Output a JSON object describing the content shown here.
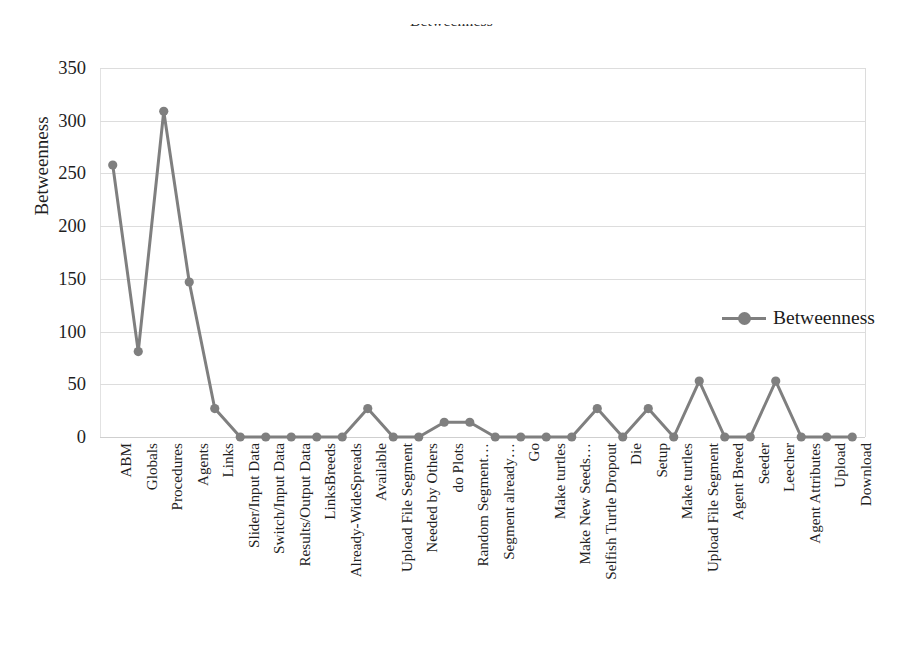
{
  "chart_data": {
    "type": "line",
    "title": "Betweenness",
    "xlabel": "",
    "ylabel": "Betweenness",
    "ylim": [
      0,
      350
    ],
    "yticks": [
      0,
      50,
      100,
      150,
      200,
      250,
      300,
      350
    ],
    "grid": "horizontal",
    "legend_position": "right-middle",
    "series_color": "#7f7f7f",
    "marker": "circle",
    "categories": [
      "ABM",
      "Globals",
      "Procedures",
      "Agents",
      "Links",
      "Slider/Input Data",
      "Switch/Input Data",
      "Results/Output Data",
      "LinksBreeds",
      "Already-WideSpreads",
      "Available",
      "Upload File Segment",
      "Needed by Others",
      "do Plots",
      "Random Segment…",
      "Segment already…",
      "Go",
      "Make turtles",
      "Make New Seeds…",
      "Selfish Turtle Dropout",
      "Die",
      "Setup",
      "Make turtles",
      "Upload File Segment",
      "Agent Breed",
      "Seeder",
      "Leecher",
      "Agent Attributes",
      "Upload",
      "Download"
    ],
    "series": [
      {
        "name": "Betweenness",
        "values": [
          258,
          81,
          309,
          147,
          27,
          0,
          0,
          0,
          0,
          0,
          27,
          0,
          0,
          14,
          14,
          0,
          0,
          0,
          0,
          27,
          0,
          27,
          0,
          53,
          0,
          0,
          53,
          0,
          0,
          0
        ]
      }
    ]
  },
  "legend": {
    "label": "Betweenness"
  }
}
